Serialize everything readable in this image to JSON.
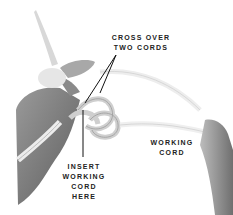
{
  "image": {
    "description": "Black and white photo of hands tying a macrame knot with cotton cord",
    "background": "#ffffff",
    "tone": "grayscale"
  },
  "annotations": {
    "cross_over": {
      "lines": [
        "CROSS OVER",
        "TWO CORDS"
      ]
    },
    "insert": {
      "lines": [
        "INSERT",
        "WORKING",
        "CORD",
        "HERE"
      ]
    },
    "working_cord": {
      "lines": [
        "WORKING",
        "CORD"
      ]
    }
  }
}
